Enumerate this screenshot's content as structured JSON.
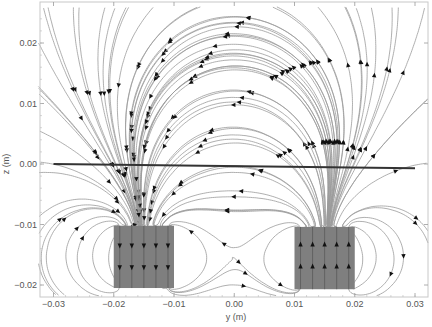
{
  "chart_data": {
    "type": "streamplot",
    "title": "",
    "xlabel": "y (m)",
    "ylabel": "z (m)",
    "xlim": [
      -0.032,
      0.032
    ],
    "ylim": [
      -0.022,
      0.026
    ],
    "xticks": [
      -0.03,
      -0.02,
      -0.01,
      0.0,
      0.01,
      0.02,
      0.03
    ],
    "xtick_labels": [
      "−0.03",
      "−0.02",
      "−0.01",
      "0.00",
      "0.01",
      "0.02",
      "0.03"
    ],
    "yticks": [
      -0.02,
      -0.01,
      0.0,
      0.01,
      0.02
    ],
    "ytick_labels": [
      "−0.02",
      "−0.01",
      "0.00",
      "0.01",
      "0.02"
    ],
    "grid": false,
    "legend": null,
    "magnets": [
      {
        "name": "left-magnet",
        "y_range": [
          -0.02,
          -0.01
        ],
        "z_range": [
          -0.0205,
          -0.0102
        ],
        "interior_field": "down",
        "fill": "#7f7f7f"
      },
      {
        "name": "right-magnet",
        "y_range": [
          0.01,
          0.02
        ],
        "z_range": [
          -0.0207,
          -0.0104
        ],
        "interior_field": "up",
        "fill": "#7f7f7f"
      }
    ],
    "reference_line": {
      "from": [
        -0.03,
        0.0
      ],
      "to": [
        0.03,
        -0.0007
      ],
      "color": "#333333",
      "width": 2
    },
    "streamline_color": "#9a9a9a",
    "arrow_color": "#111111"
  },
  "axes": {
    "x_label": "y (m)",
    "y_label": "z (m)"
  }
}
